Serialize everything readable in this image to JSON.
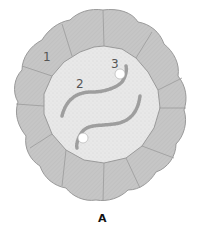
{
  "diagram": {
    "caption": "A",
    "labels": [
      {
        "id": "1",
        "text": "1",
        "x": 47,
        "y": 61
      },
      {
        "id": "2",
        "text": "2",
        "x": 80,
        "y": 87
      },
      {
        "id": "3",
        "text": "3",
        "x": 115,
        "y": 67
      }
    ],
    "colors": {
      "outer_cell": "#c8c8c8",
      "outer_stroke": "#9a9a9a",
      "inner_fill": "#e6e6e6",
      "filament": "#a8a8a8",
      "node": "#ffffff"
    },
    "outer_cell_count": 12
  }
}
